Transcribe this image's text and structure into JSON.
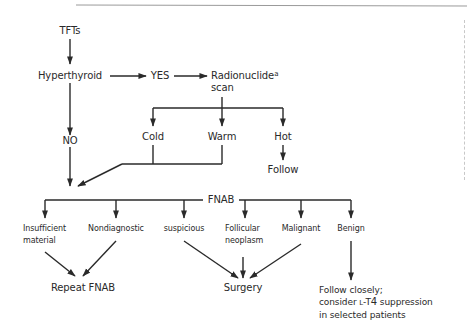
{
  "diagram": {
    "type": "flowchart",
    "nodes": {
      "tfts": "TFTs",
      "hyperthyroid": "Hyperthyroid",
      "yes": "YES",
      "no": "NO",
      "radionuclide": "Radionuclide",
      "radionuclide_sup": "a",
      "scan": "scan",
      "cold": "Cold",
      "warm": "Warm",
      "hot": "Hot",
      "follow": "Follow",
      "fnab": "FNAB",
      "insufficient_1": "Insufficient",
      "insufficient_2": "material",
      "nondiagnostic": "Nondiagnostic",
      "suspicious": "suspicious",
      "follicular_1": "Follicular",
      "follicular_2": "neoplasm",
      "malignant": "Malignant",
      "benign": "Benign",
      "repeat_fnab": "Repeat FNAB",
      "surgery": "Surgery",
      "follow_closely_1": "Follow closely;",
      "follow_closely_2a": "consider ",
      "follow_closely_2b": "L",
      "follow_closely_2c": "-T",
      "follow_closely_2d": "4",
      "follow_closely_2e": " suppression",
      "follow_closely_3": "in selected patients"
    },
    "edges": [
      [
        "TFTs",
        "Hyperthyroid"
      ],
      [
        "Hyperthyroid",
        "YES"
      ],
      [
        "YES",
        "Radionuclide scan"
      ],
      [
        "Hyperthyroid",
        "NO"
      ],
      [
        "Radionuclide scan",
        "Cold"
      ],
      [
        "Radionuclide scan",
        "Warm"
      ],
      [
        "Radionuclide scan",
        "Hot"
      ],
      [
        "Hot",
        "Follow"
      ],
      [
        "Cold",
        "FNAB"
      ],
      [
        "Warm",
        "FNAB"
      ],
      [
        "NO",
        "FNAB"
      ],
      [
        "FNAB",
        "Insufficient material"
      ],
      [
        "FNAB",
        "Nondiagnostic"
      ],
      [
        "FNAB",
        "suspicious"
      ],
      [
        "FNAB",
        "Follicular neoplasm"
      ],
      [
        "FNAB",
        "Malignant"
      ],
      [
        "FNAB",
        "Benign"
      ],
      [
        "Insufficient material",
        "Repeat FNAB"
      ],
      [
        "Nondiagnostic",
        "Repeat FNAB"
      ],
      [
        "suspicious",
        "Surgery"
      ],
      [
        "Follicular neoplasm",
        "Surgery"
      ],
      [
        "Malignant",
        "Surgery"
      ],
      [
        "Benign",
        "Follow closely; consider L-T4 suppression in selected patients"
      ]
    ],
    "colors": {
      "line": "#2a2a2a",
      "text": "#2a2a2a",
      "rule": "#9a9a9a"
    }
  }
}
